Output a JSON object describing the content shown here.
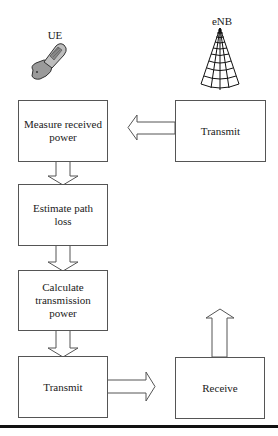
{
  "diagram": {
    "type": "flowchart",
    "actors": {
      "ue": {
        "label": "UE",
        "icon": "mobile-phone-icon"
      },
      "enb": {
        "label": "eNB",
        "icon": "cell-tower-icon"
      }
    },
    "ue_steps": [
      {
        "id": "measure",
        "label": "Measure received power"
      },
      {
        "id": "estimate",
        "label": "Estimate path loss"
      },
      {
        "id": "calculate",
        "label": "Calculate transmission power"
      },
      {
        "id": "transmit",
        "label": "Transmit"
      }
    ],
    "enb_steps": [
      {
        "id": "enb-transmit",
        "label": "Transmit"
      },
      {
        "id": "enb-receive",
        "label": "Receive"
      }
    ],
    "edges": [
      {
        "from": "enb-transmit",
        "to": "measure",
        "style": "block-arrow-left"
      },
      {
        "from": "measure",
        "to": "estimate",
        "style": "block-arrow-down"
      },
      {
        "from": "estimate",
        "to": "calculate",
        "style": "block-arrow-down"
      },
      {
        "from": "calculate",
        "to": "transmit",
        "style": "block-arrow-down"
      },
      {
        "from": "transmit",
        "to": "enb-receive",
        "style": "block-arrow-right"
      },
      {
        "from": "enb-receive",
        "to": "up",
        "style": "block-arrow-up"
      }
    ]
  }
}
